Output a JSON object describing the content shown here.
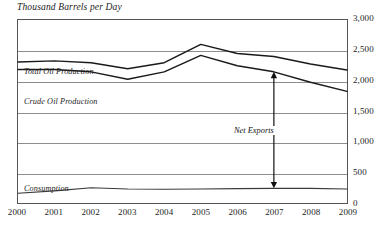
{
  "chart_data": {
    "type": "line",
    "title": "Thousand Barrels per Day",
    "xlabel": "",
    "ylabel": "Thousand Barrels per Day",
    "grid": true,
    "legend_position": "inline-labels",
    "x": [
      "2000",
      "2001",
      "2002",
      "2003",
      "2004",
      "2005",
      "2006",
      "2007",
      "2008",
      "2009"
    ],
    "xlim": [
      2000,
      2009
    ],
    "ylim": [
      0,
      3000
    ],
    "yticks": [
      3000,
      2500,
      2000,
      1500,
      1000,
      500,
      0
    ],
    "ytick_labels": [
      "3,000",
      "2,500",
      "2,000",
      "1,500",
      "1,000",
      "500",
      "0"
    ],
    "series": [
      {
        "name": "Total Oil Production",
        "values": [
          2310,
          2330,
          2300,
          2200,
          2300,
          2600,
          2450,
          2400,
          2280,
          2180
        ]
      },
      {
        "name": "Crude Oil Production",
        "values": [
          2190,
          2190,
          2150,
          2030,
          2150,
          2420,
          2250,
          2150,
          1980,
          1830
        ]
      },
      {
        "name": "Consumption",
        "values": [
          160,
          200,
          250,
          230,
          225,
          230,
          235,
          240,
          240,
          230
        ]
      }
    ],
    "annotations": [
      {
        "name": "Net Exports",
        "label": "Net Exports",
        "type": "double-arrow",
        "x": "2007",
        "y_top": 2150,
        "y_bottom": 240
      }
    ]
  },
  "labels": {
    "total_oil_production": "Total Oil Production",
    "crude_oil_production": "Crude Oil Production",
    "consumption": "Consumption",
    "net_exports": "Net Exports"
  },
  "colors": {
    "series_stroke": "#1a1a1a",
    "gridline": "#8d8d8d",
    "frame": "#555555",
    "text": "#1e1e1e",
    "background": "#ffffff"
  }
}
